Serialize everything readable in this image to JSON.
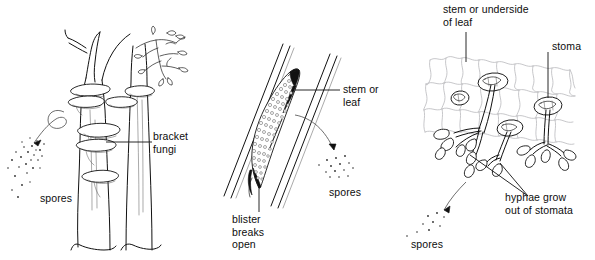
{
  "figure": {
    "background_color": "#ffffff",
    "ink_color": "#111111",
    "cell_network_color": "#b9b9bd",
    "width": 595,
    "height": 260
  },
  "panels": [
    {
      "id": "bracket-fungi-panel",
      "subject": "tree trunk with bracket fungi",
      "labels": {
        "bracket_fungi": "bracket\nfungi",
        "spores": "spores"
      },
      "elements": {
        "trunk_count": 2,
        "bracket_count": 6,
        "leafy_branch": "leafy-branch",
        "spore_cloud_dots": 27
      }
    },
    {
      "id": "blister-panel",
      "subject": "blister (pustule) on stem or leaf breaking open",
      "labels": {
        "stem_or_leaf": "stem or\nleaf",
        "spores": "spores",
        "blister_breaks_open": "blister\nbreaks\nopen"
      },
      "elements": {
        "spore_cloud_dots": 14,
        "blister_grains": 96
      }
    },
    {
      "id": "stomata-panel",
      "subject": "hyphae emerging from stomata on stem or underside of leaf",
      "labels": {
        "stem_or_underside_of_leaf": "stem or underside\nof leaf",
        "stoma": "stoma",
        "hyphae_grow_out_of_stomata": "hyphae grow\nout of stomata",
        "spores": "spores"
      },
      "elements": {
        "stomata_count": 4,
        "hyphal_clusters": 3,
        "spore_cloud_dots": 9
      }
    }
  ],
  "captions": {
    "bracket_fungi": "bracket\nfungi",
    "spores_left": "spores",
    "stem_or_leaf": "stem or\nleaf",
    "spores_middle": "spores",
    "blister_breaks_open": "blister\nbreaks\nopen",
    "stem_or_underside_of_leaf": "stem or underside\nof leaf",
    "stoma": "stoma",
    "hyphae_grow_out_of_stomata": "hyphae grow\nout of stomata",
    "spores_right": "spores"
  }
}
